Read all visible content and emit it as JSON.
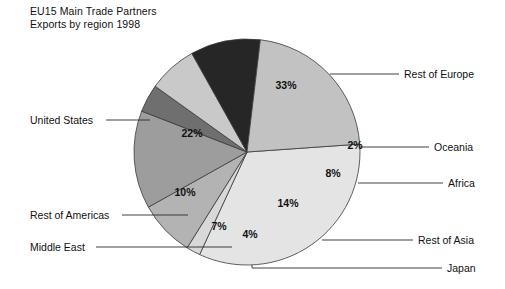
{
  "title": {
    "line1": "EU15 Main Trade Partners",
    "line2": "Exports by region 1998"
  },
  "chart_data": {
    "type": "pie",
    "title": "EU15 Main Trade Partners",
    "subtitle": "Exports by region 1998",
    "xlabel": "",
    "ylabel": "",
    "legend_position": "callout-labels",
    "grid": false,
    "unit": "%",
    "categories": [
      "Rest of Europe",
      "Oceania",
      "Africa",
      "Rest of Asia",
      "Japan",
      "Middle East",
      "Rest of Americas",
      "United States"
    ],
    "values": [
      33,
      2,
      8,
      14,
      4,
      7,
      10,
      22
    ],
    "value_labels": [
      "33%",
      "2%",
      "8%",
      "14%",
      "4%",
      "7%",
      "10%",
      "22%"
    ],
    "colors": [
      "#e4e4e4",
      "#d8d8d8",
      "#b3b3b3",
      "#9d9d9d",
      "#6f6f6f",
      "#c9c9c9",
      "#262626",
      "#c2c2c2"
    ],
    "slices": [
      {
        "name": "Rest of Europe",
        "value": 33,
        "value_label": "33%",
        "color": "#e4e4e4",
        "label_x": 286,
        "label_y": 89,
        "callout": "Rest of Europe",
        "callout_x": 404,
        "callout_y": 78
      },
      {
        "name": "Oceania",
        "value": 2,
        "value_label": "2%",
        "color": "#d8d8d8",
        "label_x": 355,
        "label_y": 149,
        "callout": "Oceania",
        "callout_x": 434,
        "callout_y": 151
      },
      {
        "name": "Africa",
        "value": 8,
        "value_label": "8%",
        "color": "#b3b3b3",
        "label_x": 333,
        "label_y": 177,
        "callout": "Africa",
        "callout_x": 448,
        "callout_y": 187
      },
      {
        "name": "Rest of Asia",
        "value": 14,
        "value_label": "14%",
        "color": "#9d9d9d",
        "label_x": 288,
        "label_y": 207,
        "callout": "Rest of Asia",
        "callout_x": 418,
        "callout_y": 244
      },
      {
        "name": "Japan",
        "value": 4,
        "value_label": "4%",
        "color": "#6f6f6f",
        "label_x": 250,
        "label_y": 238,
        "callout": "Japan",
        "callout_x": 447,
        "callout_y": 272
      },
      {
        "name": "Middle East",
        "value": 7,
        "value_label": "7%",
        "color": "#c9c9c9",
        "label_x": 219,
        "label_y": 230,
        "callout": "Middle East",
        "callout_x": 30,
        "callout_y": 251
      },
      {
        "name": "Rest of Americas",
        "value": 10,
        "value_label": "10%",
        "color": "#262626",
        "label_x": 185,
        "label_y": 196,
        "callout": "Rest of Americas",
        "callout_x": 30,
        "callout_y": 219
      },
      {
        "name": "United States",
        "value": 22,
        "value_label": "22%",
        "color": "#c2c2c2",
        "label_x": 192,
        "label_y": 137,
        "callout": "United States",
        "callout_x": 30,
        "callout_y": 124
      }
    ]
  },
  "geometry": {
    "cx": 247,
    "cy": 152,
    "r": 113,
    "start_angle_deg": -4
  }
}
